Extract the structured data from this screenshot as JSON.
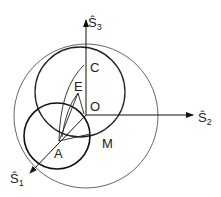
{
  "diagram": {
    "axes": {
      "s1": {
        "label": "Ŝ",
        "subscript": "1"
      },
      "s2": {
        "label": "Ŝ",
        "subscript": "2"
      },
      "s3": {
        "label": "Ŝ",
        "subscript": "3"
      }
    },
    "points": {
      "A": "A",
      "C": "C",
      "E": "E",
      "O": "O",
      "M": "M"
    },
    "colors": {
      "stroke": "#222222",
      "thin_circle": "#555555"
    }
  }
}
